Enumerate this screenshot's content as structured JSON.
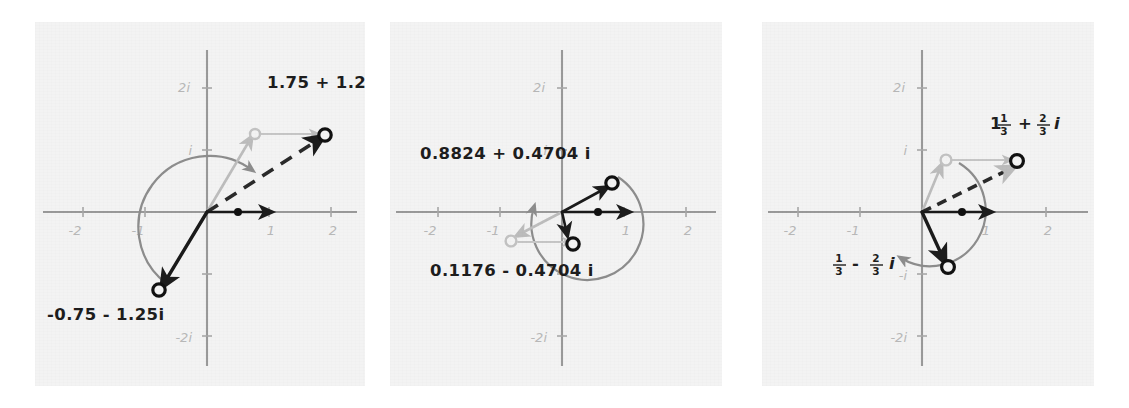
{
  "figure": {
    "panel_count": 3,
    "background_color": "#f3f3f3",
    "page_color": "#ffffff"
  },
  "axes": {
    "x_ticks": [
      "-2",
      "-1",
      "1",
      "2"
    ],
    "y_ticks": [
      "2i",
      "i",
      "-i",
      "-2i"
    ],
    "x_range": [
      -2.6,
      2.6
    ],
    "y_range": [
      -2.6,
      2.6
    ],
    "axis_color": "#9a9a9a",
    "tick_label_color": "#b8b8b8"
  },
  "panels": [
    {
      "id": "panel-left",
      "name": "Panel 1",
      "labels": {
        "upper_right": "1.75 + 1.25 i",
        "lower_left": "-0.75 - 1.25i"
      },
      "points": {
        "result": {
          "re": 1.75,
          "im": 1.25,
          "style": "open-circle-dark"
        },
        "intermediate": {
          "re": 0.75,
          "im": 1.25,
          "style": "open-circle-light"
        },
        "rotated": {
          "re": -0.75,
          "im": -1.25,
          "style": "open-circle-dark"
        },
        "unit_dot": {
          "re": 0.5,
          "im": 0,
          "style": "dot-dark"
        }
      },
      "vectors": [
        {
          "name": "light-diagonal",
          "from": [
            0,
            0
          ],
          "to": [
            0.75,
            1.25
          ],
          "style": "light"
        },
        {
          "name": "light-translate",
          "from": [
            0.75,
            1.25
          ],
          "to": [
            1.75,
            1.25
          ],
          "style": "light-thin"
        },
        {
          "name": "dashed-result",
          "from": [
            0,
            0
          ],
          "to": [
            1.75,
            1.25
          ],
          "style": "dashed"
        },
        {
          "name": "dark-real-axis",
          "from": [
            0,
            0
          ],
          "to": [
            1.1,
            0
          ],
          "style": "dark-thin"
        },
        {
          "name": "dark-rotated",
          "from": [
            0,
            0
          ],
          "to": [
            -0.75,
            -1.25
          ],
          "style": "dark"
        }
      ],
      "arc": {
        "name": "rotation-arc",
        "direction": "counterclockwise",
        "radius": 1.0
      }
    },
    {
      "id": "panel-middle",
      "name": "Panel 2",
      "labels": {
        "upper": "0.8824 + 0.4704 i",
        "lower": "0.1176 - 0.4704 i"
      },
      "points": {
        "result": {
          "re": 0.8824,
          "im": 0.4704,
          "style": "open-circle-dark"
        },
        "rotated": {
          "re": 0.1176,
          "im": -0.4704,
          "style": "open-circle-dark"
        },
        "intermediate": {
          "re": -0.8824,
          "im": -0.4704,
          "style": "open-circle-light"
        },
        "unit_dot": {
          "re": 0.5,
          "im": 0,
          "style": "dot-dark"
        }
      },
      "vectors": [
        {
          "name": "dark-result",
          "from": [
            0,
            0
          ],
          "to": [
            0.8824,
            0.4704
          ],
          "style": "dark-thin"
        },
        {
          "name": "dark-real-axis",
          "from": [
            0,
            0
          ],
          "to": [
            1.1,
            0
          ],
          "style": "dark-thin"
        },
        {
          "name": "light-to-conj",
          "from": [
            0,
            0
          ],
          "to": [
            -0.8824,
            -0.4704
          ],
          "style": "light"
        },
        {
          "name": "light-translate",
          "from": [
            -0.8824,
            -0.4704
          ],
          "to": [
            0.1176,
            -0.4704
          ],
          "style": "light-thin"
        },
        {
          "name": "dark-down",
          "from": [
            0,
            0
          ],
          "to": [
            0.05,
            -0.4
          ],
          "style": "dark-thin"
        }
      ],
      "arc": {
        "name": "rotation-arc",
        "direction": "counterclockwise",
        "radius": 0.85
      }
    },
    {
      "id": "panel-right",
      "name": "Panel 3",
      "labels": {
        "upper_right": {
          "whole": "1",
          "num": "1",
          "den": "3",
          "operator": "+",
          "frac2_num": "2",
          "frac2_den": "3",
          "imag_unit": "i"
        },
        "lower_left": {
          "num": "1",
          "den": "3",
          "operator": "-",
          "frac2_num": "2",
          "frac2_den": "3",
          "imag_unit": "i"
        },
        "upper_right_plain": "1 1/3 + 2/3 i",
        "lower_left_plain": "1/3 - 2/3 i"
      },
      "points": {
        "result": {
          "re": 1.3333,
          "im": 0.6667,
          "style": "open-circle-dark"
        },
        "intermediate": {
          "re": 0.3333,
          "im": 0.6667,
          "style": "open-circle-light"
        },
        "rotated": {
          "re": 0.3333,
          "im": -0.6667,
          "style": "open-circle-dark"
        },
        "unit_dot": {
          "re": 0.5,
          "im": 0,
          "style": "dot-dark"
        }
      },
      "vectors": [
        {
          "name": "light-diagonal",
          "from": [
            0,
            0
          ],
          "to": [
            0.3333,
            0.6667
          ],
          "style": "light"
        },
        {
          "name": "light-translate",
          "from": [
            0.3333,
            0.6667
          ],
          "to": [
            1.3333,
            0.6667
          ],
          "style": "light-thin"
        },
        {
          "name": "dashed-result",
          "from": [
            0,
            0
          ],
          "to": [
            1.3333,
            0.6667
          ],
          "style": "dashed-thin"
        },
        {
          "name": "dark-real-axis",
          "from": [
            0,
            0
          ],
          "to": [
            1.1,
            0
          ],
          "style": "dark-thin"
        },
        {
          "name": "dark-rotated",
          "from": [
            0,
            0
          ],
          "to": [
            0.3333,
            -0.6667
          ],
          "style": "dark"
        }
      ],
      "arc": {
        "name": "rotation-arc",
        "direction": "counterclockwise",
        "radius": 0.75
      }
    }
  ]
}
